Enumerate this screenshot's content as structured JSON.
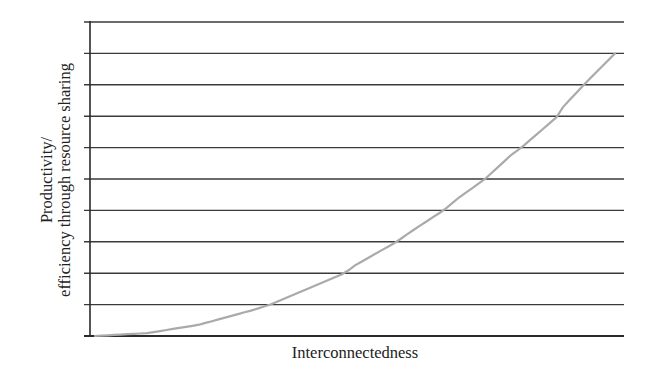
{
  "chart_data": {
    "type": "line",
    "title": "",
    "xlabel": "Interconnectedness",
    "ylabel_lines": [
      "Productivity/",
      "efficiency through resource sharing"
    ],
    "ylabel": "Productivity/ efficiency through resource sharing",
    "x_ticks": [],
    "y_ticks": [],
    "grid": true,
    "grid_lines_count": 11,
    "xlim": [
      0,
      10
    ],
    "ylim": [
      0,
      10
    ],
    "legend": null,
    "series": [
      {
        "name": "Productivity curve",
        "color": "#aaaaaa",
        "x": [
          0,
          1,
          2,
          3,
          3.37,
          4,
          4.8,
          5,
          5.8,
          6,
          6.7,
          7,
          7.5,
          8,
          8.2,
          8.9,
          9,
          9.4,
          10
        ],
        "y": [
          0,
          0.09,
          0.36,
          0.81,
          1.0,
          1.44,
          2.0,
          2.25,
          3.0,
          3.24,
          4.0,
          4.41,
          5.0,
          5.76,
          6.0,
          7.0,
          7.29,
          8.0,
          9.0
        ]
      }
    ]
  },
  "colors": {
    "grid": "#3a3a3a",
    "axis": "#2a2a2a",
    "curve": "#aaaaaa",
    "text": "#222222"
  }
}
